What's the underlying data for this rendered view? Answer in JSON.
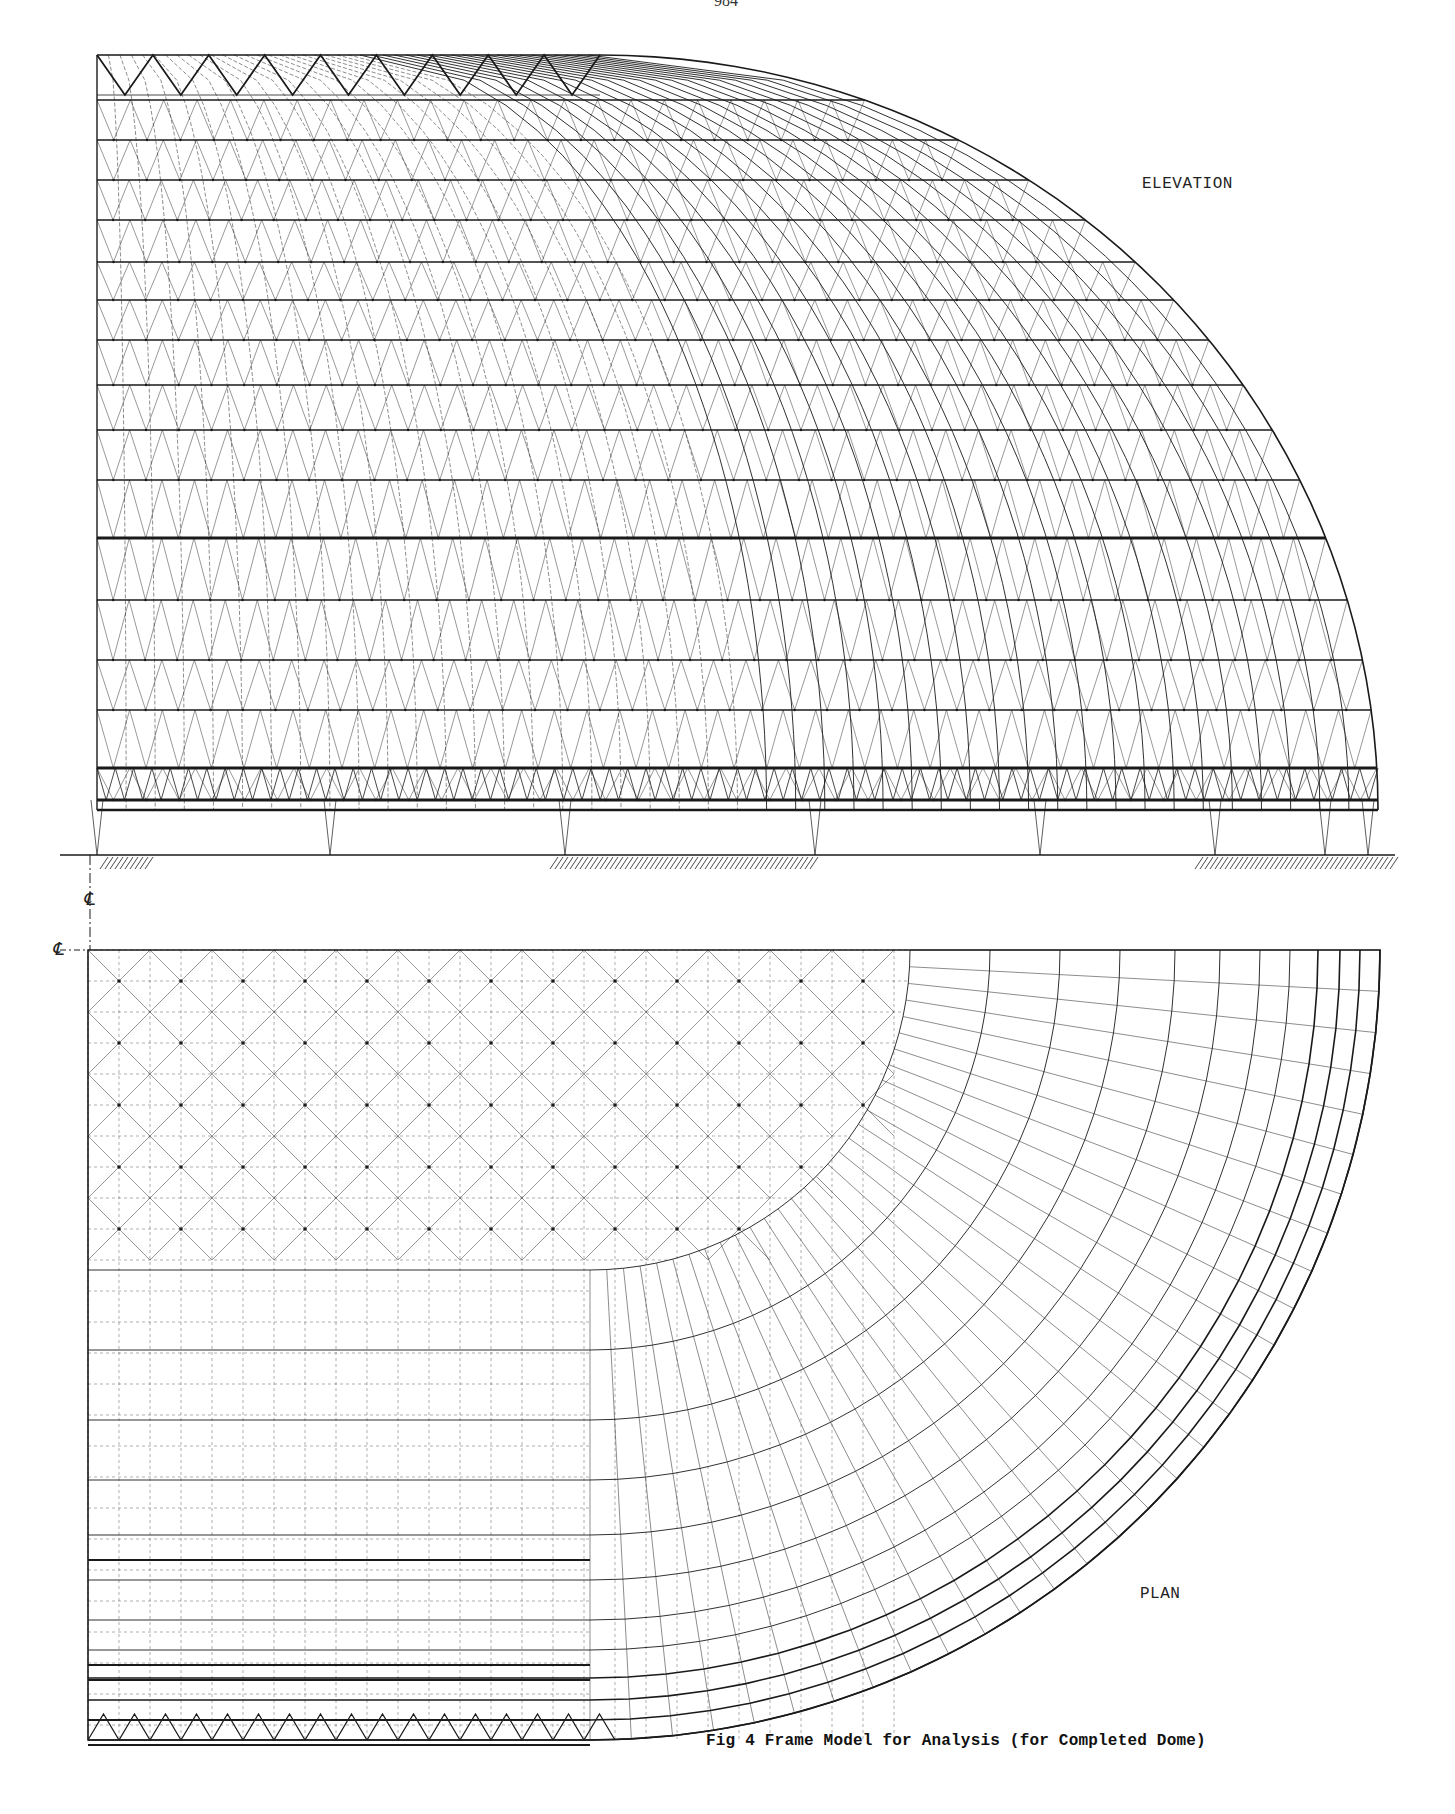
{
  "page": {
    "number": "984"
  },
  "figure": {
    "caption": "Fig 4  Frame Model for Analysis (for Completed Dome)",
    "views": [
      {
        "id": "elevation",
        "label": "ELEVATION"
      },
      {
        "id": "plan",
        "label": "PLAN"
      }
    ],
    "centerline_symbol": "℄",
    "ink_color": "#1a1a1a",
    "background_color": "#ffffff"
  },
  "elevation": {
    "left_x": 97,
    "straight_end_x": 600,
    "top_y": 55,
    "right_x": 1378,
    "springing_y": 810,
    "ring_bands_y": [
      100,
      140,
      180,
      220,
      262,
      300,
      340,
      385,
      430,
      480,
      538,
      600,
      660,
      710,
      768,
      800
    ],
    "heavy_bands_y": [
      538,
      545,
      768,
      800
    ],
    "support_x": [
      97,
      330,
      565,
      815,
      1040,
      1215,
      1325,
      1368
    ],
    "ground_y": 855,
    "hatched_ground_segments": [
      [
        100,
        150
      ],
      [
        550,
        815
      ],
      [
        1195,
        1395
      ]
    ]
  },
  "plan": {
    "left_x": 88,
    "top_y": 950,
    "straight_end_x": 590,
    "radius": 790,
    "rings_offsets": [
      0,
      20,
      40,
      62,
      90,
      120,
      160,
      205,
      260,
      320,
      390,
      470
    ],
    "heavy_rows_y": [
      1560,
      1665,
      1680,
      1720,
      1745
    ]
  }
}
